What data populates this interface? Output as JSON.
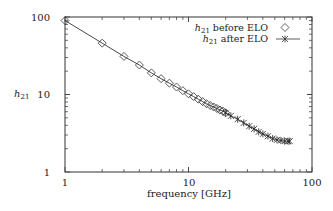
{
  "chart_data": {
    "type": "line",
    "title": "",
    "xlabel": "frequency [GHz]",
    "ylabel": "h21",
    "xscale": "log",
    "yscale": "log",
    "xlim": [
      1,
      100
    ],
    "ylim": [
      1,
      100
    ],
    "x_ticks": [
      "1",
      "10",
      "100"
    ],
    "y_ticks": [
      "1",
      "10",
      "100"
    ],
    "grid": false,
    "legend_position": "upper right",
    "series": [
      {
        "name": "h21 before ELO",
        "marker": "diamond",
        "x": [
          1,
          2,
          3,
          4,
          5,
          6,
          7,
          8,
          9,
          10,
          11,
          12,
          13,
          14,
          15,
          16,
          17,
          18,
          19,
          20
        ],
        "values": [
          90,
          46,
          31,
          24,
          19,
          16,
          14,
          12.5,
          11.2,
          10.2,
          9.4,
          8.7,
          8.1,
          7.6,
          7.2,
          6.9,
          6.6,
          6.3,
          6.1,
          5.8
        ]
      },
      {
        "name": "h21 after ELO",
        "marker": "star-line",
        "x": [
          20,
          22,
          25,
          28,
          31,
          34,
          37,
          40,
          44,
          48,
          52,
          56,
          60,
          64,
          66
        ],
        "values": [
          5.8,
          5.3,
          4.8,
          4.3,
          3.9,
          3.6,
          3.3,
          3.1,
          2.9,
          2.7,
          2.6,
          2.55,
          2.5,
          2.5,
          2.5
        ]
      }
    ]
  },
  "legend": {
    "before_label": "before ELO",
    "after_label": "after ELO",
    "symbol": "h",
    "subscript": "21"
  },
  "axes": {
    "x_tick_1": "1",
    "x_tick_10": "10",
    "x_tick_100": "100",
    "y_tick_1": "1",
    "y_tick_10": "10",
    "y_tick_100": "100",
    "xlabel": "frequency [GHz]",
    "ylabel_symbol": "h",
    "ylabel_sub": "21"
  }
}
